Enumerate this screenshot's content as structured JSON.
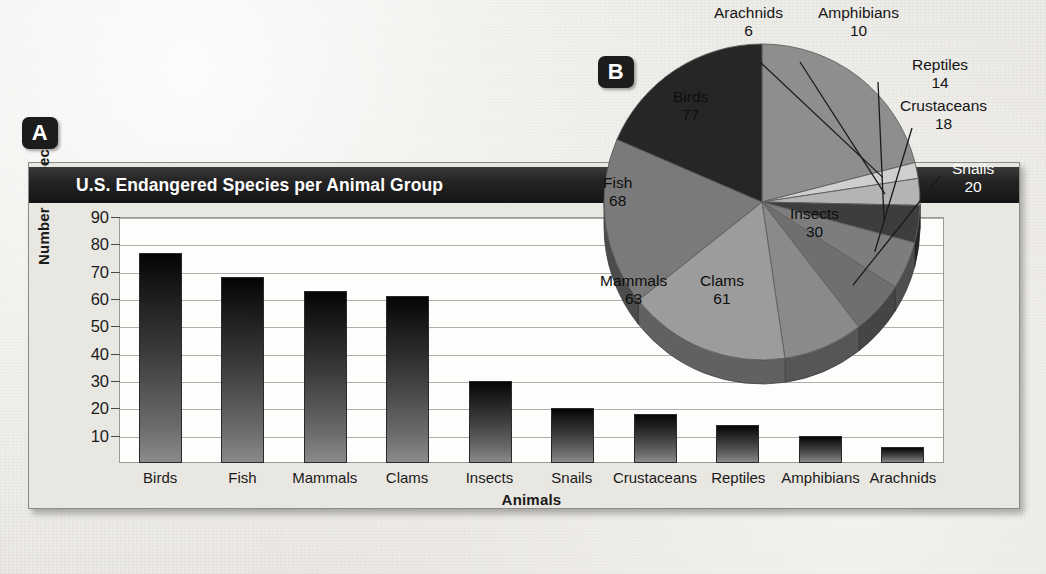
{
  "badges": {
    "a": "A",
    "b": "B"
  },
  "panel_a": {
    "title": "U.S. Endangered Species per Animal Group",
    "ylabel": "Number of species",
    "xlabel": "Animals",
    "yticks": [
      "90",
      "80",
      "70",
      "60",
      "50",
      "40",
      "30",
      "20",
      "10"
    ]
  },
  "colors": {
    "titlebar": "#1a1a1a",
    "badge": "#1c1c1c",
    "paper": "#ecebe6",
    "plot_bg": "#fdfdfb",
    "bar_dark": "#0a0a0a",
    "bar_light": "#8a8a8a"
  },
  "chart_data": [
    {
      "type": "bar",
      "title": "U.S. Endangered Species per Animal Group",
      "xlabel": "Animals",
      "ylabel": "Number of species",
      "ylim": [
        0,
        90
      ],
      "ytick_step": 10,
      "grid": true,
      "legend": "none",
      "categories": [
        "Birds",
        "Fish",
        "Mammals",
        "Clams",
        "Insects",
        "Snails",
        "Crustaceans",
        "Reptiles",
        "Amphibians",
        "Arachnids"
      ],
      "values": [
        77,
        68,
        63,
        61,
        30,
        20,
        18,
        14,
        10,
        6
      ]
    },
    {
      "type": "pie",
      "title": "",
      "legend": "labels-on-slices-and-callouts",
      "labels": [
        "Birds",
        "Arachnids",
        "Amphibians",
        "Reptiles",
        "Crustaceans",
        "Snails",
        "Insects",
        "Clams",
        "Mammals",
        "Fish"
      ],
      "values": [
        77,
        6,
        10,
        14,
        18,
        20,
        30,
        61,
        63,
        68
      ],
      "total": 367
    }
  ],
  "pie_labels": [
    {
      "name": "Arachnids",
      "value": "6"
    },
    {
      "name": "Amphibians",
      "value": "10"
    },
    {
      "name": "Reptiles",
      "value": "14"
    },
    {
      "name": "Crustaceans",
      "value": "18"
    },
    {
      "name": "Snails",
      "value": "20"
    },
    {
      "name": "Insects",
      "value": "30"
    },
    {
      "name": "Clams",
      "value": "61"
    },
    {
      "name": "Mammals",
      "value": "63"
    },
    {
      "name": "Fish",
      "value": "68"
    },
    {
      "name": "Birds",
      "value": "77"
    }
  ]
}
